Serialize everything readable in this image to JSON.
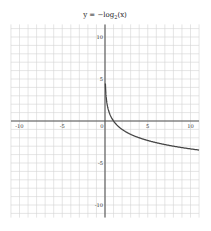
{
  "chart_data": {
    "type": "line",
    "title_parts": {
      "prefix": "y = −log",
      "subscript": "2",
      "suffix": "(x)"
    },
    "xlabel": "",
    "ylabel": "",
    "xlim": [
      -11,
      11
    ],
    "ylim": [
      -11.5,
      11.5
    ],
    "grid": true,
    "grid_step": 1,
    "x_ticks": [
      -10,
      -5,
      0,
      5,
      10
    ],
    "y_ticks": [
      10,
      5,
      -5,
      -10
    ],
    "x_tick_labels": [
      "-10",
      "-5",
      "0",
      "5",
      "10"
    ],
    "y_tick_labels": [
      "10",
      "5",
      "-5",
      "-10"
    ],
    "legend": null,
    "series": [
      {
        "name": "y = −log₂(x)",
        "function": "-log2(x)",
        "domain": [
          0.045,
          11
        ],
        "color": "#444444",
        "x": [
          0.045,
          0.0625,
          0.125,
          0.25,
          0.5,
          1,
          2,
          3,
          4,
          5,
          6,
          7,
          8,
          9,
          10,
          11
        ],
        "y": [
          4.47,
          4.0,
          3.0,
          2.0,
          1.0,
          0.0,
          -1.0,
          -1.58,
          -2.0,
          -2.32,
          -2.58,
          -2.81,
          -3.0,
          -3.17,
          -3.32,
          -3.46
        ]
      }
    ]
  },
  "colors": {
    "grid": "#d4d4d4",
    "axis": "#555555",
    "curve": "#444444",
    "background": "#ffffff"
  }
}
